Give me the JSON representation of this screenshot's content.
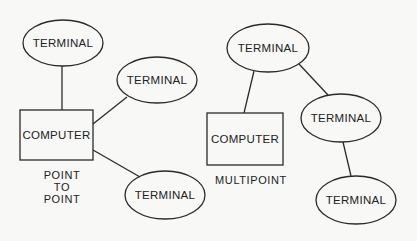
{
  "diagrams": [
    {
      "caption_lines": [
        "POINT",
        "TO",
        "POINT"
      ],
      "computer": {
        "label": "COMPUTER",
        "x": 20,
        "y": 110,
        "w": 73,
        "h": 50
      },
      "terminals": [
        {
          "label": "TERMINAL",
          "cx": 63,
          "cy": 43,
          "rx": 40,
          "ry": 23
        },
        {
          "label": "TERMINAL",
          "cx": 157,
          "cy": 80,
          "rx": 40,
          "ry": 23
        },
        {
          "label": "TERMINAL",
          "cx": 165,
          "cy": 195,
          "rx": 40,
          "ry": 24
        }
      ],
      "edges": [
        {
          "from": "terminal-1",
          "to": "computer"
        },
        {
          "from": "computer",
          "to": "terminal-2"
        },
        {
          "from": "computer",
          "to": "terminal-3"
        }
      ]
    },
    {
      "caption_lines": [
        "MULTIPOINT"
      ],
      "computer": {
        "label": "COMPUTER",
        "x": 207,
        "y": 113,
        "w": 76,
        "h": 52
      },
      "terminals": [
        {
          "label": "TERMINAL",
          "cx": 268,
          "cy": 48,
          "rx": 41,
          "ry": 24
        },
        {
          "label": "TERMINAL",
          "cx": 341,
          "cy": 118,
          "rx": 40,
          "ry": 24
        },
        {
          "label": "TERMINAL",
          "cx": 356,
          "cy": 200,
          "rx": 40,
          "ry": 24
        }
      ],
      "edges": [
        {
          "from": "terminal-1",
          "to": "computer"
        },
        {
          "from": "terminal-1",
          "to": "terminal-2"
        },
        {
          "from": "terminal-2",
          "to": "terminal-3"
        }
      ]
    }
  ]
}
